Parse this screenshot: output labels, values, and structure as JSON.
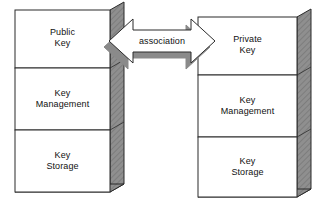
{
  "diagram": {
    "colors": {
      "box_fill": "#ffffff",
      "box_stroke": "#2b2b2b",
      "extrusion_fill": "#8f8f8f",
      "extrusion_stroke": "#2b2b2b",
      "arrow_fill": "#ffffff",
      "arrow_stroke": "#2b2b2b",
      "arrow_shadow": "#8a8a8a",
      "text": "#111111",
      "background": "#ffffff"
    },
    "left_stack": {
      "name": "public-key-stack",
      "cells": [
        {
          "label": "Public\nKey"
        },
        {
          "label": "Key\nManagement"
        },
        {
          "label": "Key\nStorage"
        }
      ]
    },
    "right_stack": {
      "name": "private-key-stack",
      "cells": [
        {
          "label": "Private\nKey"
        },
        {
          "label": "Key\nManagement"
        },
        {
          "label": "Key\nStorage"
        }
      ]
    },
    "connector": {
      "name": "association-arrow",
      "label": "association",
      "style": "double-headed-arrow",
      "direction": "bidirectional"
    }
  }
}
